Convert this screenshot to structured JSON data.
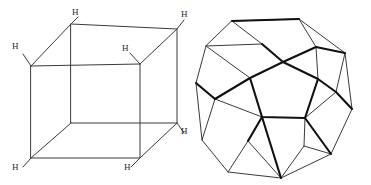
{
  "figure": {
    "title": "",
    "background_color": "#ffffff",
    "width": 371,
    "height": 185,
    "thin_stroke_color": "#3a3a3a",
    "bold_stroke_color": "#111111"
  },
  "cube": {
    "name": "hydrogen-labelled-cube",
    "label_text": "H",
    "vertices": {
      "front_top_left": [
        31,
        66
      ],
      "front_top_right": [
        140,
        64
      ],
      "front_bottom_left": [
        31,
        158
      ],
      "front_bottom_right": [
        140,
        158
      ],
      "back_top_left": [
        71,
        24
      ],
      "back_top_right": [
        177,
        29
      ],
      "back_bottom_left": [
        71,
        123
      ],
      "back_bottom_right": [
        177,
        123
      ]
    },
    "labels": [
      {
        "id": "h-back-top-left",
        "text": "H",
        "x": 72,
        "y": 8
      },
      {
        "id": "h-back-top-right",
        "text": "H",
        "x": 181,
        "y": 10
      },
      {
        "id": "h-front-top-left",
        "text": "H",
        "x": 12,
        "y": 42
      },
      {
        "id": "h-front-top-right",
        "text": "H",
        "x": 122,
        "y": 44
      },
      {
        "id": "h-back-bottom-right",
        "text": "H",
        "x": 181,
        "y": 127
      },
      {
        "id": "h-front-bottom-left",
        "text": "H",
        "x": 12,
        "y": 163
      },
      {
        "id": "h-front-bottom-right",
        "text": "H",
        "x": 124,
        "y": 163
      }
    ]
  },
  "dodecahedron": {
    "name": "dodecahedron-projection",
    "center": [
      283,
      98
    ],
    "outer_vertices": [
      [
        232,
        21
      ],
      [
        299,
        19
      ],
      [
        345,
        53
      ],
      [
        352,
        109
      ],
      [
        331,
        154
      ],
      [
        281,
        178
      ],
      [
        228,
        172
      ],
      [
        202,
        140
      ],
      [
        196,
        83
      ],
      [
        206,
        46
      ]
    ],
    "inner_vertices": [
      [
        283,
        62
      ],
      [
        250,
        78
      ],
      [
        262,
        117
      ],
      [
        305,
        118
      ],
      [
        318,
        79
      ]
    ],
    "mid_vertices": [
      [
        262,
        44
      ],
      [
        316,
        47
      ],
      [
        336,
        92
      ],
      [
        304,
        146
      ],
      [
        248,
        141
      ],
      [
        215,
        99
      ]
    ],
    "bold_edges_note": "front pentagon-cluster edges rendered heavier"
  }
}
